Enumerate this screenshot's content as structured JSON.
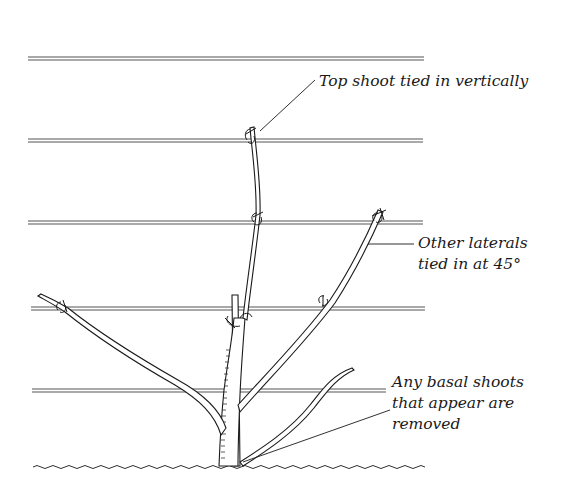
{
  "diagram": {
    "wires_count": 5,
    "colors": {
      "ink": "#1a1a1a",
      "wire": "#555555",
      "background": "#ffffff"
    },
    "labels": {
      "top_shoot": {
        "lines": [
          "Top shoot tied in vertically"
        ]
      },
      "other_laterals": {
        "lines": [
          "Other laterals",
          "tied in at 45°"
        ]
      },
      "basal_shoots": {
        "lines": [
          "Any basal shoots",
          "that appear are",
          "removed"
        ]
      }
    }
  }
}
